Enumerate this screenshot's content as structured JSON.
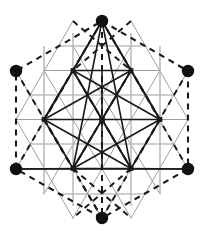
{
  "figure": {
    "canvas": {
      "width": 203,
      "height": 238,
      "background": "#ffffff"
    },
    "colors": {
      "dark": "#1a1a1a",
      "grid_gray": "#8c8c8c",
      "grid_light": "#b9b9b9",
      "node_fill": "#111111",
      "background": "#ffffff"
    },
    "geometry": {
      "center": {
        "x": 102,
        "y": 119.5
      },
      "hex_radius": 99,
      "cell": 29,
      "lattice_rows": 4
    },
    "nodes": [
      {
        "id": "top",
        "label": "Top vertex",
        "x": 102,
        "y": 21,
        "r": 6.2
      },
      {
        "id": "upper-left",
        "label": "Upper-left vertex",
        "x": 16,
        "y": 71,
        "r": 6.2
      },
      {
        "id": "upper-right",
        "label": "Upper-right vertex",
        "x": 188,
        "y": 71,
        "r": 6.2
      },
      {
        "id": "lower-left",
        "label": "Lower-left vertex",
        "x": 16,
        "y": 169,
        "r": 6.2
      },
      {
        "id": "lower-right",
        "label": "Lower-right vertex",
        "x": 188,
        "y": 169,
        "r": 6.2
      },
      {
        "id": "bottom",
        "label": "Bottom vertex",
        "x": 102,
        "y": 218,
        "r": 6.2
      }
    ],
    "inner_points": [
      {
        "id": "inner-center",
        "x": 102,
        "y": 119.5
      },
      {
        "id": "inner-upper-left",
        "x": 73,
        "y": 70.5
      },
      {
        "id": "inner-upper-right",
        "x": 131,
        "y": 70.5
      },
      {
        "id": "inner-mid-left",
        "x": 44,
        "y": 119.5
      },
      {
        "id": "inner-mid-right",
        "x": 160,
        "y": 119.5
      },
      {
        "id": "inner-lower-left",
        "x": 73,
        "y": 168.5
      },
      {
        "id": "inner-lower-right",
        "x": 131,
        "y": 168.5
      }
    ],
    "hexagon_outline": {
      "style": "dashed",
      "color": "#1a1a1a",
      "dash": "6 5",
      "width": 2.1,
      "points": "102,21 188,71 188,169 102,218 16,169 16,71"
    },
    "vertical_dashed_axis": {
      "style": "dashed",
      "color": "#1a1a1a",
      "dash": "6 5",
      "width": 2.1,
      "from": {
        "x": 102,
        "y": 21
      },
      "to": {
        "x": 102,
        "y": 218
      }
    },
    "left_dashed_edge": {
      "from": {
        "x": 16,
        "y": 71
      },
      "to": {
        "x": 16,
        "y": 169
      }
    },
    "right_dashed_edge": {
      "from": {
        "x": 188,
        "y": 71
      },
      "to": {
        "x": 188,
        "y": 169
      }
    },
    "legend": {
      "solid_label": "solid connection",
      "dashed_label": "dashed connection",
      "grid_label": "lattice grid",
      "node_label": "vertex node"
    }
  }
}
